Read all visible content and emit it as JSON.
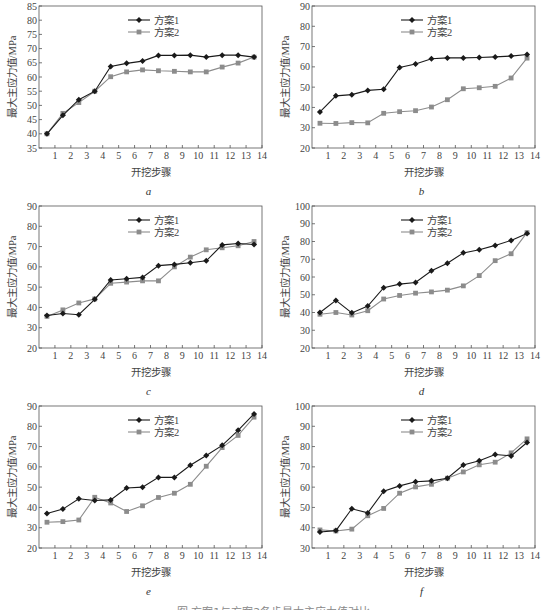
{
  "figure": {
    "caption": "图 方案1与方案2各步最大主应力值对比",
    "colors": {
      "series1": "#1a1a1a",
      "series2": "#8c8c8c",
      "axis": "#555555"
    }
  },
  "chart_data": [
    {
      "id": "a",
      "type": "line",
      "label": "a",
      "xlabel": "开挖步骤",
      "ylabel": "最大主应力值/MPa",
      "xlim": [
        0,
        14
      ],
      "ylim": [
        35,
        85
      ],
      "yticks": [
        35,
        40,
        45,
        50,
        55,
        60,
        65,
        70,
        75,
        80,
        85
      ],
      "xticks": [
        1,
        2,
        3,
        4,
        5,
        6,
        7,
        8,
        9,
        10,
        11,
        12,
        13,
        14
      ],
      "legend": {
        "position": "upper-center",
        "entries": [
          "方案1",
          "方案2"
        ]
      },
      "x": [
        0.5,
        1.5,
        2.5,
        3.5,
        4.5,
        5.5,
        6.5,
        7.5,
        8.5,
        9.5,
        10.5,
        11.5,
        12.5,
        13.5
      ],
      "series": [
        {
          "name": "方案1",
          "marker": "diamond",
          "values": [
            40,
            46.5,
            52,
            55,
            63.7,
            64.8,
            65.6,
            67.6,
            67.6,
            67.7,
            67,
            67.7,
            67.7,
            67
          ]
        },
        {
          "name": "方案2",
          "marker": "square",
          "values": [
            40,
            47.2,
            51,
            55,
            60.1,
            61.8,
            62.5,
            62.2,
            62,
            61.8,
            61.8,
            63.5,
            64.9,
            67
          ]
        }
      ]
    },
    {
      "id": "b",
      "type": "line",
      "label": "b",
      "xlabel": "开挖步骤",
      "ylabel": "最大主应力值/MPa",
      "xlim": [
        0,
        14
      ],
      "ylim": [
        20,
        90
      ],
      "yticks": [
        20,
        30,
        40,
        50,
        60,
        70,
        80,
        90
      ],
      "xticks": [
        1,
        2,
        3,
        4,
        5,
        6,
        7,
        8,
        9,
        10,
        11,
        12,
        13,
        14
      ],
      "legend": {
        "position": "upper-center",
        "entries": [
          "方案1",
          "方案2"
        ]
      },
      "x": [
        0.5,
        1.5,
        2.5,
        3.5,
        4.5,
        5.5,
        6.5,
        7.5,
        8.5,
        9.5,
        10.5,
        11.5,
        12.5,
        13.5
      ],
      "series": [
        {
          "name": "方案1",
          "marker": "diamond",
          "values": [
            37.8,
            45.7,
            46.3,
            48.4,
            49,
            59.7,
            61.4,
            64,
            64.4,
            64.4,
            64.6,
            64.9,
            65.3,
            66.1
          ]
        },
        {
          "name": "方案2",
          "marker": "square",
          "values": [
            32.2,
            32.1,
            32.5,
            32.4,
            37.1,
            37.9,
            38.4,
            40.2,
            43.8,
            49.2,
            49.7,
            50.4,
            54.5,
            64.3
          ]
        }
      ]
    },
    {
      "id": "c",
      "type": "line",
      "label": "c",
      "xlabel": "开挖步骤",
      "ylabel": "最大主应力值/MPa",
      "xlim": [
        0,
        14
      ],
      "ylim": [
        20,
        90
      ],
      "yticks": [
        20,
        30,
        40,
        50,
        60,
        70,
        80,
        90
      ],
      "xticks": [
        1,
        2,
        3,
        4,
        5,
        6,
        7,
        8,
        9,
        10,
        11,
        12,
        13,
        14
      ],
      "legend": {
        "position": "upper-center",
        "entries": [
          "方案1",
          "方案2"
        ]
      },
      "x": [
        0.5,
        1.5,
        2.5,
        3.5,
        4.5,
        5.5,
        6.5,
        7.5,
        8.5,
        9.5,
        10.5,
        11.5,
        12.5,
        13.5
      ],
      "series": [
        {
          "name": "方案1",
          "marker": "diamond",
          "values": [
            36,
            37,
            36.4,
            44,
            53.5,
            54.1,
            54.8,
            60.6,
            61.2,
            62,
            63,
            70.8,
            71.5,
            71
          ]
        },
        {
          "name": "方案2",
          "marker": "square",
          "values": [
            35.6,
            38.8,
            42.2,
            44.2,
            51.9,
            52.5,
            53.1,
            53.1,
            60,
            64.8,
            68.4,
            69.4,
            70.4,
            72.5
          ]
        }
      ]
    },
    {
      "id": "d",
      "type": "line",
      "label": "d",
      "xlabel": "开挖步骤",
      "ylabel": "最大主应力值/MPa",
      "xlim": [
        0,
        14
      ],
      "ylim": [
        20,
        100
      ],
      "yticks": [
        20,
        30,
        40,
        50,
        60,
        70,
        80,
        90,
        100
      ],
      "xticks": [
        1,
        2,
        3,
        4,
        5,
        6,
        7,
        8,
        9,
        10,
        11,
        12,
        13,
        14
      ],
      "legend": {
        "position": "upper-center",
        "entries": [
          "方案1",
          "方案2"
        ]
      },
      "x": [
        0.5,
        1.5,
        2.5,
        3.5,
        4.5,
        5.5,
        6.5,
        7.5,
        8.5,
        9.5,
        10.5,
        11.5,
        12.5,
        13.5
      ],
      "series": [
        {
          "name": "方案1",
          "marker": "diamond",
          "values": [
            40,
            46.8,
            39.8,
            43.6,
            54,
            56,
            56.9,
            63.5,
            67.8,
            73.6,
            75.4,
            77.8,
            80.6,
            84.5
          ]
        },
        {
          "name": "方案2",
          "marker": "square",
          "values": [
            39,
            40,
            38.6,
            41,
            47.6,
            49.6,
            50.9,
            51.6,
            52.6,
            55,
            60.8,
            69.2,
            73.1,
            85
          ]
        }
      ]
    },
    {
      "id": "e",
      "type": "line",
      "label": "e",
      "xlabel": "开挖步骤",
      "ylabel": "最大主应力值/MPa",
      "xlim": [
        0,
        14
      ],
      "ylim": [
        20,
        90
      ],
      "yticks": [
        20,
        30,
        40,
        50,
        60,
        70,
        80,
        90
      ],
      "xticks": [
        1,
        2,
        3,
        4,
        5,
        6,
        7,
        8,
        9,
        10,
        11,
        12,
        13,
        14
      ],
      "legend": {
        "position": "upper-center",
        "entries": [
          "方案1",
          "方案2"
        ]
      },
      "x": [
        0.5,
        1.5,
        2.5,
        3.5,
        4.5,
        5.5,
        6.5,
        7.5,
        8.5,
        9.5,
        10.5,
        11.5,
        12.5,
        13.5
      ],
      "series": [
        {
          "name": "方案1",
          "marker": "diamond",
          "values": [
            37,
            39.2,
            44.3,
            43.4,
            43.7,
            49.6,
            50,
            54.8,
            54.8,
            60.8,
            65.6,
            70.6,
            78,
            86.1
          ]
        },
        {
          "name": "方案2",
          "marker": "square",
          "values": [
            32.7,
            33,
            33.8,
            45,
            42.2,
            38,
            40.8,
            44.9,
            47,
            51.4,
            60.3,
            69.5,
            75.5,
            84.5
          ]
        }
      ]
    },
    {
      "id": "f",
      "type": "line",
      "label": "f",
      "xlabel": "开挖步骤",
      "ylabel": "最大主应力值/MPa",
      "xlim": [
        0,
        14
      ],
      "ylim": [
        30,
        100
      ],
      "yticks": [
        30,
        40,
        50,
        60,
        70,
        80,
        90,
        100
      ],
      "xticks": [
        1,
        2,
        3,
        4,
        5,
        6,
        7,
        8,
        9,
        10,
        11,
        12,
        13,
        14
      ],
      "legend": {
        "position": "upper-center",
        "entries": [
          "方案1",
          "方案2"
        ]
      },
      "x": [
        0.5,
        1.5,
        2.5,
        3.5,
        4.5,
        5.5,
        6.5,
        7.5,
        8.5,
        9.5,
        10.5,
        11.5,
        12.5,
        13.5
      ],
      "series": [
        {
          "name": "方案1",
          "marker": "diamond",
          "values": [
            37.9,
            38.6,
            49.3,
            47.3,
            58,
            60.6,
            62.7,
            63.1,
            64.4,
            70.9,
            73,
            76.1,
            75.4,
            82
          ]
        },
        {
          "name": "方案2",
          "marker": "square",
          "values": [
            38.9,
            38.4,
            39.3,
            45.9,
            49.5,
            57,
            60.1,
            61.4,
            64.4,
            67.5,
            71,
            72.3,
            76.9,
            83.8
          ]
        }
      ]
    }
  ]
}
